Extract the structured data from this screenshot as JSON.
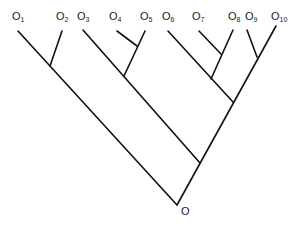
{
  "diagram": {
    "type": "phylogenetic-tree",
    "root_label": "O",
    "leaves": [
      {
        "id": "O1",
        "base": "O",
        "sub": "1"
      },
      {
        "id": "O2",
        "base": "O",
        "sub": "2"
      },
      {
        "id": "O3",
        "base": "O",
        "sub": "3"
      },
      {
        "id": "O4",
        "base": "O",
        "sub": "4"
      },
      {
        "id": "O5",
        "base": "O",
        "sub": "5"
      },
      {
        "id": "O6",
        "base": "O",
        "sub": "6"
      },
      {
        "id": "O7",
        "base": "O",
        "sub": "7"
      },
      {
        "id": "O8",
        "base": "O",
        "sub": "8"
      },
      {
        "id": "O9",
        "base": "O",
        "sub": "9"
      },
      {
        "id": "O10",
        "base": "O",
        "sub": "10"
      }
    ],
    "topology": "((O1,O2),((O3,(O4,O5)),((O6,(O7,O8)),(O9,O10))))O",
    "line_color": "#111111"
  }
}
